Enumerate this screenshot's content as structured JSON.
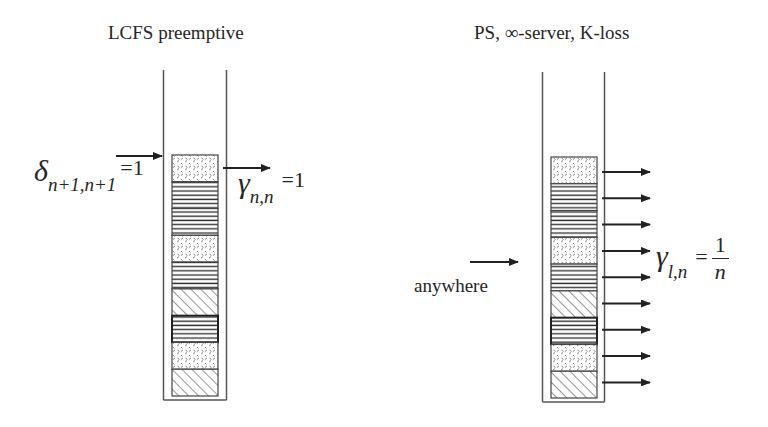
{
  "left_panel": {
    "title": "LCFS preemptive",
    "input_label": {
      "symbol": "δ",
      "subscript": "n+1,n+1",
      "equals": "=1"
    },
    "output_label": {
      "symbol": "γ",
      "subscript": "n,n",
      "equals": "=1"
    },
    "blocks": [
      "dots",
      "lines",
      "lines",
      "dots",
      "lines",
      "hatch",
      "lines-dark",
      "dots",
      "hatch"
    ],
    "input_arrows": 1,
    "output_arrows": 1
  },
  "right_panel": {
    "title": "PS, ∞-server, K-loss",
    "input_label": "anywhere",
    "output_label": {
      "symbol": "γ",
      "subscript": "l,n",
      "equals": "=",
      "numerator": "1",
      "denominator": "n"
    },
    "blocks": [
      "dots",
      "lines",
      "lines",
      "dots",
      "lines",
      "hatch",
      "lines-dark",
      "dots",
      "hatch"
    ],
    "input_arrows": 1,
    "output_arrows": 9
  },
  "colors": {
    "ink": "#262626",
    "wall": "#555555",
    "background": "#ffffff"
  }
}
